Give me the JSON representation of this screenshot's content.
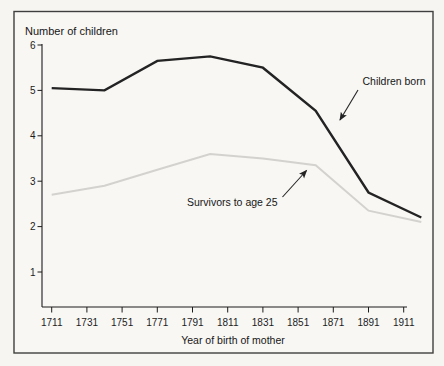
{
  "figure": {
    "title": "Number of children",
    "xlabel": "Year of birth of mother"
  },
  "annotations": {
    "children_born": "Children born",
    "survivors": "Survivors to age 25"
  },
  "colors": {
    "children_born_line": "#232323",
    "survivors_line": "#d4d2ce",
    "axis": "#1c1c1c",
    "frame_border": "#3f3f3f",
    "background": "#f6f5f2"
  },
  "chart_data": {
    "type": "line",
    "title": "Number of children",
    "xlabel": "Year of birth of mother",
    "x": [
      1711,
      1741,
      1771,
      1801,
      1831,
      1861,
      1891,
      1921
    ],
    "series": [
      {
        "name": "Children born",
        "color": "#232323",
        "width": 2.4,
        "values": [
          5.05,
          5.0,
          5.65,
          5.75,
          5.5,
          4.55,
          2.75,
          2.2
        ]
      },
      {
        "name": "Survivors to age 25",
        "color": "#d4d2ce",
        "width": 2.0,
        "values": [
          2.7,
          2.9,
          3.25,
          3.6,
          3.5,
          3.35,
          2.35,
          2.1
        ]
      }
    ],
    "ylim": [
      0,
      6
    ],
    "yticks": [
      6,
      5,
      4,
      3,
      2,
      1
    ],
    "xticks": [
      1711,
      1731,
      1751,
      1771,
      1791,
      1811,
      1831,
      1851,
      1871,
      1891,
      1911
    ],
    "grid": false,
    "legend_position": "inline-arrow-annotations"
  }
}
